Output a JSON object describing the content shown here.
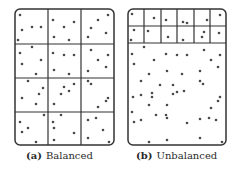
{
  "panels": [
    {
      "id": "a",
      "tag": "(a)",
      "label": "Balanced",
      "box": {
        "x": 15,
        "y": 9,
        "w": 99,
        "h": 136,
        "r": 5
      },
      "grid": {
        "cols": [
          48,
          81
        ],
        "rows": [
          44,
          78,
          112
        ]
      },
      "points": [
        [
          20,
          15
        ],
        [
          22,
          30
        ],
        [
          32,
          27
        ],
        [
          41,
          27
        ],
        [
          18,
          40
        ],
        [
          53,
          20
        ],
        [
          64,
          27
        ],
        [
          74,
          22
        ],
        [
          54,
          37
        ],
        [
          69,
          40
        ],
        [
          108,
          15
        ],
        [
          98,
          20
        ],
        [
          91,
          28
        ],
        [
          106,
          33
        ],
        [
          88,
          37
        ],
        [
          32,
          47
        ],
        [
          20,
          53
        ],
        [
          22,
          64
        ],
        [
          41,
          60
        ],
        [
          36,
          74
        ],
        [
          53,
          53
        ],
        [
          64,
          55
        ],
        [
          74,
          55
        ],
        [
          54,
          70
        ],
        [
          69,
          74
        ],
        [
          91,
          50
        ],
        [
          108,
          55
        ],
        [
          98,
          60
        ],
        [
          106,
          67
        ],
        [
          88,
          71
        ],
        [
          28,
          81
        ],
        [
          43,
          88
        ],
        [
          39,
          94
        ],
        [
          22,
          98
        ],
        [
          36,
          104
        ],
        [
          74,
          84
        ],
        [
          64,
          87
        ],
        [
          69,
          91
        ],
        [
          61,
          94
        ],
        [
          54,
          104
        ],
        [
          88,
          81
        ],
        [
          91,
          84
        ],
        [
          108,
          98
        ],
        [
          106,
          101
        ],
        [
          98,
          107
        ],
        [
          44,
          115
        ],
        [
          20,
          122
        ],
        [
          28,
          128
        ],
        [
          22,
          132
        ],
        [
          36,
          142
        ],
        [
          61,
          115
        ],
        [
          53,
          122
        ],
        [
          54,
          128
        ],
        [
          74,
          133
        ],
        [
          54,
          140
        ],
        [
          96,
          118
        ],
        [
          88,
          120
        ],
        [
          103,
          130
        ],
        [
          88,
          138
        ],
        [
          109,
          142
        ]
      ]
    },
    {
      "id": "b",
      "tag": "(b)",
      "label": "Unbalanced",
      "box": {
        "x": 128,
        "y": 9,
        "w": 98,
        "h": 136,
        "r": 5
      },
      "grid": {
        "cols": [
          144,
          161,
          177,
          194,
          210
        ],
        "rows": [
          26,
          43
        ],
        "grid_bottom": 43
      },
      "points": [
        [
          132,
          14
        ],
        [
          154,
          18
        ],
        [
          166,
          20
        ],
        [
          183,
          22
        ],
        [
          187,
          23
        ],
        [
          207,
          20
        ],
        [
          220,
          15
        ],
        [
          134,
          30
        ],
        [
          148,
          31
        ],
        [
          131,
          40
        ],
        [
          168,
          37
        ],
        [
          183,
          40
        ],
        [
          204,
          32
        ],
        [
          202,
          37
        ],
        [
          219,
          33
        ],
        [
          144,
          47
        ],
        [
          132,
          54
        ],
        [
          166,
          54
        ],
        [
          177,
          55
        ],
        [
          187,
          55
        ],
        [
          204,
          50
        ],
        [
          220,
          55
        ],
        [
          134,
          64
        ],
        [
          154,
          60
        ],
        [
          211,
          60
        ],
        [
          218,
          67
        ],
        [
          149,
          74
        ],
        [
          167,
          71
        ],
        [
          182,
          74
        ],
        [
          200,
          71
        ],
        [
          141,
          81
        ],
        [
          160,
          85
        ],
        [
          173,
          85
        ],
        [
          200,
          81
        ],
        [
          203,
          84
        ],
        [
          152,
          93
        ],
        [
          177,
          92
        ],
        [
          141,
          95
        ],
        [
          133,
          97
        ],
        [
          152,
          97
        ],
        [
          173,
          94
        ],
        [
          184,
          91
        ],
        [
          220,
          97
        ],
        [
          218,
          101
        ],
        [
          149,
          105
        ],
        [
          167,
          105
        ],
        [
          211,
          108
        ],
        [
          132,
          112
        ],
        [
          156,
          115
        ],
        [
          166,
          115
        ],
        [
          200,
          119
        ],
        [
          209,
          118
        ],
        [
          134,
          122
        ],
        [
          141,
          120
        ],
        [
          167,
          118
        ],
        [
          187,
          123
        ],
        [
          216,
          120
        ],
        [
          149,
          142
        ],
        [
          167,
          140
        ],
        [
          200,
          138
        ],
        [
          222,
          142
        ]
      ]
    }
  ],
  "colors": {
    "stroke": "#333333",
    "dot": "#4a4a4a",
    "text": "#2a2a2a"
  }
}
